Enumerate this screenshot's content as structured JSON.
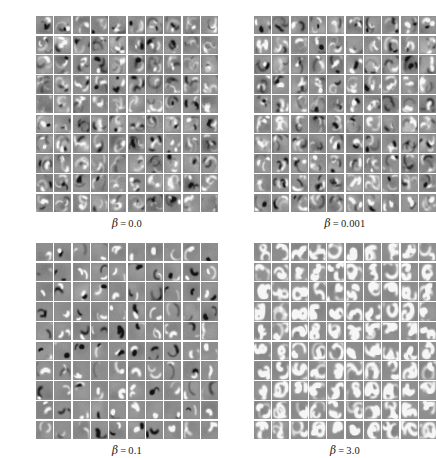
{
  "figure": {
    "type": "image-grid-figure",
    "background_color": "#ffffff",
    "tile_base_color": "#8e8e8e",
    "grid_rows": 10,
    "grid_cols": 10,
    "panel_count": 4,
    "caption": ""
  },
  "panels": [
    {
      "id": "panel-beta-0",
      "label_symbol": "β",
      "label_equals": "=",
      "label_value": "0.0",
      "label_full": "β = 0.0",
      "seed": 11,
      "stroke_strength": 0.3,
      "stroke_count": 5,
      "noise": 0.55
    },
    {
      "id": "panel-beta-0001",
      "label_symbol": "β",
      "label_equals": "=",
      "label_value": "0.001",
      "label_full": "β = 0.001",
      "seed": 27,
      "stroke_strength": 0.34,
      "stroke_count": 5,
      "noise": 0.52
    },
    {
      "id": "panel-beta-01",
      "label_symbol": "β",
      "label_equals": "=",
      "label_value": "0.1",
      "label_full": "β = 0.1",
      "seed": 43,
      "stroke_strength": 0.52,
      "stroke_count": 2,
      "noise": 0.22
    },
    {
      "id": "panel-beta-3",
      "label_symbol": "β",
      "label_equals": "=",
      "label_value": "3.0",
      "label_full": "β = 3.0",
      "seed": 61,
      "stroke_strength": 0.95,
      "stroke_count": 3,
      "noise": 0.1,
      "digit_like": true
    }
  ]
}
